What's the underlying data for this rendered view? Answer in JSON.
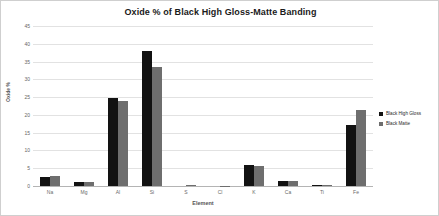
{
  "chart_data": {
    "type": "bar",
    "title": "Oxide % of Black High Gloss-Matte Banding",
    "xlabel": "Element",
    "ylabel": "Oxide %",
    "categories": [
      "Na",
      "Mg",
      "Al",
      "Si",
      "S",
      "Cl",
      "K",
      "Ca",
      "Ti",
      "Fe"
    ],
    "series": [
      {
        "name": "Black High Gloss",
        "color": "#121212",
        "values": [
          2.6,
          1.1,
          24.8,
          38.1,
          0.0,
          0.0,
          6.0,
          1.4,
          0.3,
          17.3
        ]
      },
      {
        "name": "Black Matte",
        "color": "#6e6e6e",
        "values": [
          2.7,
          1.2,
          24.0,
          33.6,
          0.3,
          0.05,
          5.7,
          1.5,
          0.25,
          21.5
        ]
      }
    ],
    "ylim": [
      0,
      45
    ],
    "ytick_labels": [
      "45",
      "40",
      "35",
      "30",
      "25",
      "20",
      "15",
      "10",
      "5",
      "0"
    ],
    "ytick_values": [
      45,
      40,
      35,
      30,
      25,
      20,
      15,
      10,
      5,
      0
    ],
    "grid": true,
    "legend_position": "right"
  }
}
